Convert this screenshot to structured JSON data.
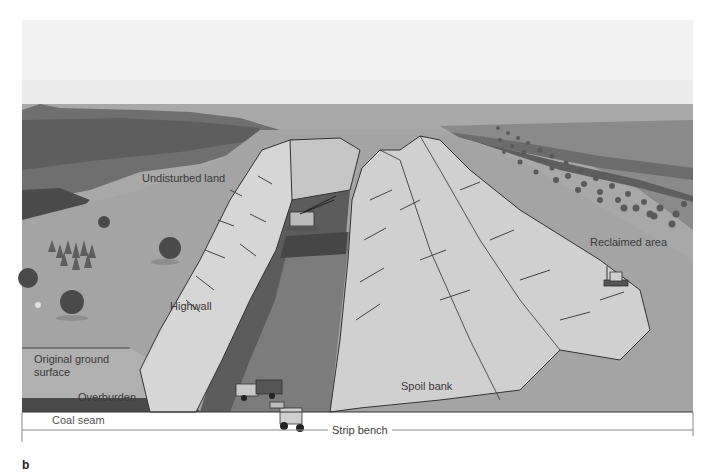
{
  "figure": {
    "panel_letter": "b",
    "labels": {
      "undisturbed_land": "Undisturbed land",
      "highwall": "Highwall",
      "reclaimed_area": "Reclaimed area",
      "original_ground_surface_line1": "Original ground",
      "original_ground_surface_line2": "surface",
      "overburden": "Overburden",
      "coal_seam": "Coal seam",
      "spoil_bank": "Spoil bank",
      "strip_bench": "Strip bench"
    },
    "colors": {
      "sky": "#eeeeee",
      "ground": "#a9a9a9",
      "distant_plateau": "#7a7a7a",
      "dark_cliff": "#4e4e4e",
      "spoil_light": "#d4d4d4",
      "pit_floor": "#7c7c7c",
      "pit_dark": "#5a5a5a",
      "coal_seam": "#4a4a4a",
      "overburden": "#b3b3b3",
      "outline": "#333333"
    }
  }
}
